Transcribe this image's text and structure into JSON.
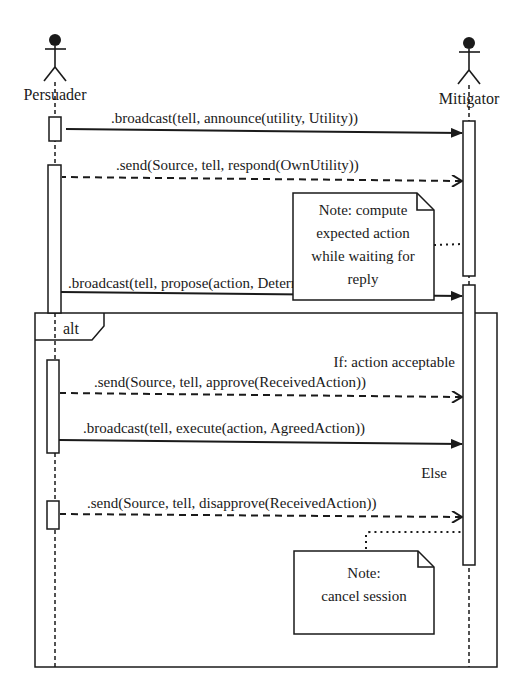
{
  "diagram": {
    "type": "uml-sequence-diagram",
    "lifelines": [
      {
        "id": "persuader",
        "label": "Persuader"
      },
      {
        "id": "mitigator",
        "label": "Mitigator"
      }
    ],
    "messages": [
      {
        "id": "m1",
        "from": "persuader",
        "to": "mitigator",
        "style": "solid",
        "label": ".broadcast(tell, announce(utility, Utility))"
      },
      {
        "id": "m2",
        "from": "mitigator",
        "to": "persuader",
        "style": "dashed",
        "label": ".send(Source, tell, respond(OwnUtility))"
      },
      {
        "id": "m3",
        "from": "persuader",
        "to": "mitigator",
        "style": "solid",
        "label": ".broadcast(tell, propose(action, DeterminedAction))"
      },
      {
        "id": "m4",
        "from": "mitigator",
        "to": "persuader",
        "style": "dashed",
        "label": ".send(Source, tell, approve(ReceivedAction))"
      },
      {
        "id": "m5",
        "from": "persuader",
        "to": "mitigator",
        "style": "solid",
        "label": ".broadcast(tell, execute(action, AgreedAction))"
      },
      {
        "id": "m6",
        "from": "mitigator",
        "to": "persuader",
        "style": "dashed",
        "label": ".send(Source, tell, disapprove(ReceivedAction))"
      }
    ],
    "notes": [
      {
        "id": "n1",
        "lines": [
          "Note: compute",
          "expected action",
          "while waiting for",
          "reply"
        ]
      },
      {
        "id": "n2",
        "lines": [
          "Note:",
          "cancel session"
        ]
      }
    ],
    "fragment": {
      "operator": "alt",
      "guards": [
        "If: action acceptable",
        "Else"
      ]
    }
  }
}
